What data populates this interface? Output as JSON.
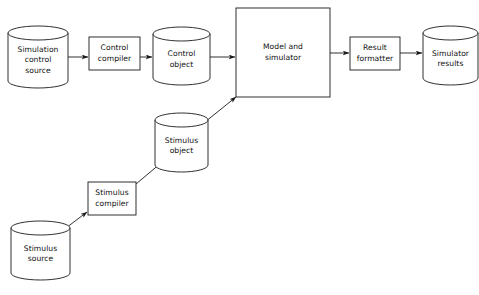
{
  "diagram": {
    "background_color": "#ffffff",
    "stroke_color": "#1a1a1a",
    "text_color": "#111111",
    "nodes": [
      {
        "id": "simulation-control-source",
        "type": "cylinder",
        "label": "Simulation\ncontrol\nsource",
        "x": 8,
        "y": 26,
        "width": 60,
        "height": 62,
        "ellipse_ry": 7
      },
      {
        "id": "control-compiler",
        "type": "box",
        "label": "Control\ncompiler",
        "x": 89,
        "y": 37,
        "width": 51,
        "height": 33
      },
      {
        "id": "control-object",
        "type": "cylinder",
        "label": "Control\nobject",
        "x": 153,
        "y": 27,
        "width": 57,
        "height": 58,
        "ellipse_ry": 7
      },
      {
        "id": "model-and-simulator",
        "type": "box",
        "label": "Model and\nsimulator",
        "x": 236,
        "y": 8,
        "width": 94,
        "height": 89
      },
      {
        "id": "result-formatter",
        "type": "box",
        "label": "Result\nformatter",
        "x": 350,
        "y": 37,
        "width": 50,
        "height": 33
      },
      {
        "id": "simulator-results",
        "type": "cylinder",
        "label": "Simulator\nresults",
        "x": 423,
        "y": 26,
        "width": 55,
        "height": 59,
        "ellipse_ry": 7
      },
      {
        "id": "stimulus-object",
        "type": "cylinder",
        "label": "Stimulus\nobject",
        "x": 155,
        "y": 113,
        "width": 53,
        "height": 59,
        "ellipse_ry": 7
      },
      {
        "id": "stimulus-compiler",
        "type": "box",
        "label": "Stimulus\ncompiler",
        "x": 88,
        "y": 182,
        "width": 48,
        "height": 33
      },
      {
        "id": "stimulus-source",
        "type": "cylinder",
        "label": "Stimulus\nsource",
        "x": 11,
        "y": 221,
        "width": 59,
        "height": 59,
        "ellipse_ry": 7
      }
    ],
    "edges": [
      {
        "id": "edge-source-to-control-compiler",
        "from": "simulation-control-source",
        "to": "control-compiler",
        "x1": 68,
        "y1": 57,
        "x2": 88,
        "y2": 57
      },
      {
        "id": "edge-control-compiler-to-control-object",
        "from": "control-compiler",
        "to": "control-object",
        "x1": 140,
        "y1": 57,
        "x2": 152,
        "y2": 57
      },
      {
        "id": "edge-control-object-to-model",
        "from": "control-object",
        "to": "model-and-simulator",
        "x1": 210,
        "y1": 57,
        "x2": 235,
        "y2": 57
      },
      {
        "id": "edge-model-to-result-formatter",
        "from": "model-and-simulator",
        "to": "result-formatter",
        "x1": 330,
        "y1": 53,
        "x2": 349,
        "y2": 53
      },
      {
        "id": "edge-result-formatter-to-results",
        "from": "result-formatter",
        "to": "simulator-results",
        "x1": 400,
        "y1": 53,
        "x2": 422,
        "y2": 53
      },
      {
        "id": "edge-stimulus-object-to-model",
        "from": "stimulus-object",
        "to": "model-and-simulator",
        "x1": 205,
        "y1": 122,
        "x2": 236,
        "y2": 97
      },
      {
        "id": "edge-stimulus-compiler-to-stimulus-object",
        "from": "stimulus-compiler",
        "to": "stimulus-object",
        "x1": 136,
        "y1": 184,
        "x2": 161,
        "y2": 163
      },
      {
        "id": "edge-stimulus-source-to-stimulus-compiler",
        "from": "stimulus-source",
        "to": "stimulus-compiler",
        "x1": 62,
        "y1": 231,
        "x2": 87,
        "y2": 212
      }
    ]
  }
}
